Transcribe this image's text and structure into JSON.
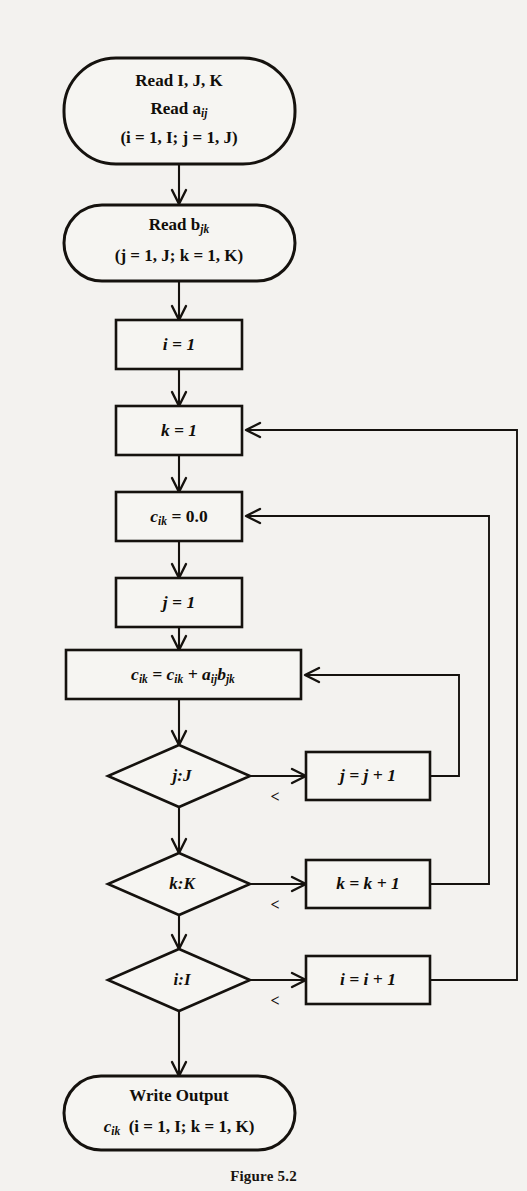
{
  "figure": {
    "caption": "Figure 5.2",
    "background_color": "#f3f2ef",
    "ink_color": "#15120e"
  },
  "diagram": {
    "type": "flowchart",
    "nodes": [
      {
        "id": "read-input",
        "shape": "terminal",
        "lines": [
          "Read I, J, K",
          "Read a",
          "(i = 1, I; j = 1, J)"
        ],
        "sub": "ij",
        "text": "Read I, J, K / Read a_ij / (i = 1, I; j = 1, J)"
      },
      {
        "id": "read-b",
        "shape": "terminal",
        "lines": [
          "Read b",
          "(j = 1, J; k = 1, K)"
        ],
        "sub": "jk",
        "text": "Read b_jk / (j = 1, J; k = 1, K)"
      },
      {
        "id": "init-i",
        "shape": "process",
        "text": "i = 1"
      },
      {
        "id": "init-k",
        "shape": "process",
        "text": "k = 1"
      },
      {
        "id": "init-c",
        "shape": "process",
        "text": "c_ik = 0.0",
        "lhs": "c",
        "lhs_sub": "ik",
        "rhs": "= 0.0"
      },
      {
        "id": "init-j",
        "shape": "process",
        "text": "j = 1"
      },
      {
        "id": "accumulate",
        "shape": "process",
        "text": "c_ik = c_ik + a_ij b_jk"
      },
      {
        "id": "test-j",
        "shape": "decision",
        "text": "j:J"
      },
      {
        "id": "test-k",
        "shape": "decision",
        "text": "k:K"
      },
      {
        "id": "test-i",
        "shape": "decision",
        "text": "i:I"
      },
      {
        "id": "incr-j",
        "shape": "process",
        "text": "j = j + 1"
      },
      {
        "id": "incr-k",
        "shape": "process",
        "text": "k = k + 1"
      },
      {
        "id": "incr-i",
        "shape": "process",
        "text": "i = i + 1"
      },
      {
        "id": "write-output",
        "shape": "terminal",
        "lines": [
          "Write Output",
          "c   (i = 1, I; k = 1, K)"
        ],
        "sub": "ik",
        "text": "Write Output / c_ik (i = 1, I; k = 1, K)"
      }
    ],
    "edge_labels": {
      "less_than": "<"
    },
    "edges": [
      {
        "from": "read-input",
        "to": "read-b",
        "label": ""
      },
      {
        "from": "read-b",
        "to": "init-i",
        "label": ""
      },
      {
        "from": "init-i",
        "to": "init-k",
        "label": ""
      },
      {
        "from": "init-k",
        "to": "init-c",
        "label": ""
      },
      {
        "from": "init-c",
        "to": "init-j",
        "label": ""
      },
      {
        "from": "init-j",
        "to": "accumulate",
        "label": ""
      },
      {
        "from": "accumulate",
        "to": "test-j",
        "label": ""
      },
      {
        "from": "test-j",
        "to": "incr-j",
        "label": "<"
      },
      {
        "from": "incr-j",
        "to": "accumulate",
        "label": ""
      },
      {
        "from": "test-j",
        "to": "test-k",
        "label": ""
      },
      {
        "from": "test-k",
        "to": "incr-k",
        "label": "<"
      },
      {
        "from": "incr-k",
        "to": "init-c",
        "label": ""
      },
      {
        "from": "test-k",
        "to": "test-i",
        "label": ""
      },
      {
        "from": "test-i",
        "to": "incr-i",
        "label": "<"
      },
      {
        "from": "incr-i",
        "to": "init-k",
        "label": ""
      },
      {
        "from": "test-i",
        "to": "write-output",
        "label": ""
      }
    ]
  },
  "labels": {
    "read_ijk": "Read I, J, K",
    "read_a_prefix": "Read a",
    "read_a_sub": "ij",
    "range_a": "(i = 1, I; j = 1, J)",
    "read_b_prefix": "Read b",
    "read_b_sub": "jk",
    "range_b": "(j = 1, J; k = 1, K)",
    "init_i": "i = 1",
    "init_k": "k = 1",
    "init_c_lhs": "c",
    "init_c_sub": "ik",
    "init_c_rhs": "= 0.0",
    "init_j": "j = 1",
    "acc_c1": "c",
    "acc_sub1": "ik",
    "acc_eq": "= c",
    "acc_sub2": "ik",
    "acc_plus": "+ a",
    "acc_sub3": "ij",
    "acc_b": "b",
    "acc_sub4": "jk",
    "test_j": "j:J",
    "test_k": "k:K",
    "test_i": "i:I",
    "incr_j": "j = j + 1",
    "incr_k": "k = k + 1",
    "incr_i": "i = i + 1",
    "lt_j": "<",
    "lt_k": "<",
    "lt_i": "<",
    "write_output": "Write Output",
    "write_c": "c",
    "write_sub": "ik",
    "write_range": "(i = 1, I; k = 1, K)"
  }
}
